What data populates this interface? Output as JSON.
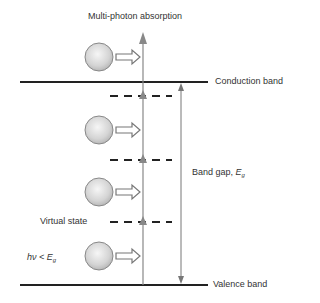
{
  "title": "Multi-photon absorption",
  "labels": {
    "conduction_band": "Conduction band",
    "valence_band": "Valence band",
    "band_gap": "Band gap, ",
    "band_gap_symbol": "E",
    "band_gap_sub": "g",
    "virtual_state": "Virtual state",
    "photon_energy": "hν < E",
    "photon_energy_sub": "g"
  },
  "colors": {
    "band_line": "#222222",
    "arrow": "#888888",
    "ball_fill": "#d8d8d8",
    "ball_stroke": "#777777"
  },
  "levels": {
    "conduction_band_y": 82,
    "valence_band_y": 285,
    "virtual_states_y": [
      96,
      160,
      222
    ]
  },
  "photons": [
    {
      "id": 1,
      "y": 57
    },
    {
      "id": 2,
      "y": 130
    },
    {
      "id": 3,
      "y": 192
    },
    {
      "id": 4,
      "y": 256
    }
  ]
}
